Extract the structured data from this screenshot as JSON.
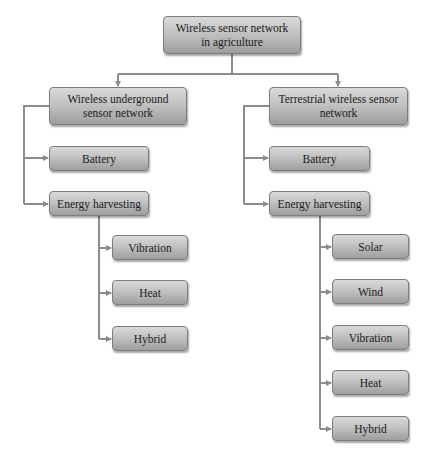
{
  "diagram": {
    "title": "Wireless sensor network in agriculture",
    "root": {
      "line1": "Wireless sensor network",
      "line2": "in agriculture"
    },
    "left_branch": {
      "line1": "Wireless underground",
      "line2": "sensor network",
      "battery": "Battery",
      "energy_harvesting": "Energy harvesting",
      "sources": [
        "Vibration",
        "Heat",
        "Hybrid"
      ]
    },
    "right_branch": {
      "line1": "Terrestrial wireless sensor",
      "line2": "network",
      "battery": "Battery",
      "energy_harvesting": "Energy harvesting",
      "sources": [
        "Solar",
        "Wind",
        "Vibration",
        "Heat",
        "Hybrid"
      ]
    },
    "colors": {
      "connector": "#8c8c8c",
      "box_top": "#d9d9d9",
      "box_bottom": "#9e9e9e",
      "text": "#1a1a1a"
    }
  }
}
